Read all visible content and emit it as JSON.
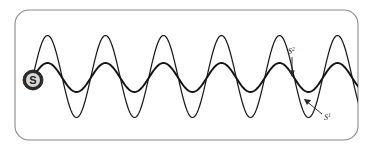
{
  "figure": {
    "background_color": "#ffffff",
    "frame": {
      "name": "rounded-rectangle-frame",
      "x": 15,
      "y": 10,
      "width": 343,
      "height": 130,
      "corner_radius": 14,
      "stroke_color": "#8a8a8a",
      "stroke_width": 1.1
    }
  },
  "source": {
    "label": "S",
    "icon": "filled-circle-source-icon",
    "center_x": 33,
    "center_y": 80,
    "radius": 10,
    "outer_color": "#2a2a2a",
    "inner_color": "#d8d8d8",
    "text_color": "#1f1f1f"
  },
  "waves": [
    {
      "id": "s1",
      "label": "S",
      "superscript": "1",
      "description": "large amplitude high-excursion wave",
      "baseline_y": 76.5,
      "amplitude": 41,
      "period": 58,
      "phase_offset": 0,
      "stroke_color": "#1b1b1b",
      "stroke_width": 1.25,
      "peak_y": 35,
      "trough_y": 118,
      "cycles_visible": 5
    },
    {
      "id": "s2",
      "label": "S",
      "superscript": "2",
      "description": "small amplitude wave",
      "baseline_y": 77.5,
      "amplitude": 14.5,
      "period": 58,
      "phase_offset": 0,
      "stroke_color": "#141414",
      "stroke_width": 1.9,
      "peak_y": 63,
      "trough_y": 92,
      "cycles_visible": 5
    }
  ],
  "annotations": [
    {
      "id": "annotation-s2",
      "label": "S",
      "superscript": "2",
      "text_x": 288,
      "text_y": 54,
      "arrow_from_x": 292,
      "arrow_from_y": 57,
      "arrow_to_x": 292,
      "arrow_to_y": 77,
      "arrow_direction": "down",
      "stroke_color": "#2a2a2a"
    },
    {
      "id": "annotation-s1",
      "label": "S",
      "superscript": "1",
      "text_x": 324,
      "text_y": 118,
      "arrow_from_x": 322,
      "arrow_from_y": 114,
      "arrow_to_x": 304,
      "arrow_to_y": 99,
      "arrow_direction": "up-left",
      "stroke_color": "#2a2a2a"
    }
  ]
}
